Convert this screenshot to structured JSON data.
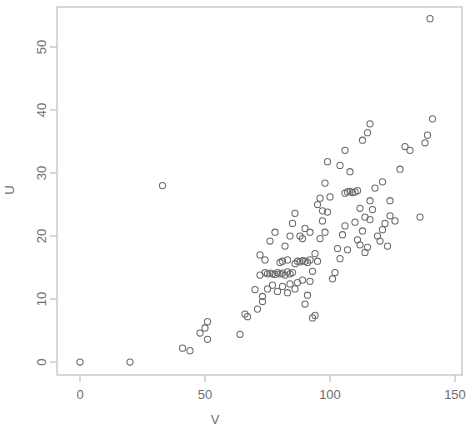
{
  "chart_data": {
    "type": "scatter",
    "title": "",
    "subtitle": "",
    "xlabel": "V",
    "ylabel": "U",
    "xlim": [
      -5,
      150
    ],
    "ylim": [
      -2,
      57
    ],
    "xticks": [
      0,
      50,
      100,
      150
    ],
    "yticks": [
      0,
      10,
      20,
      30,
      40,
      50
    ],
    "xtick_labels": [
      "0",
      "50",
      "100",
      "150"
    ],
    "ytick_labels": [
      "0",
      "10",
      "20",
      "30",
      "40",
      "50"
    ],
    "grid": false,
    "legend": null,
    "marker": "open-circle",
    "marker_color": "#6a6a6a",
    "marker_radius_px": 3.1,
    "annotations": [],
    "n_points": 120,
    "points": [
      [
        0,
        0
      ],
      [
        20,
        0
      ],
      [
        33,
        28
      ],
      [
        41,
        2.2
      ],
      [
        44,
        1.8
      ],
      [
        48,
        4.6
      ],
      [
        50,
        5.4
      ],
      [
        51,
        3.6
      ],
      [
        51,
        6.4
      ],
      [
        64,
        4.4
      ],
      [
        66,
        7.6
      ],
      [
        67,
        7.2
      ],
      [
        70,
        11.5
      ],
      [
        71,
        8.4
      ],
      [
        72,
        13.8
      ],
      [
        73,
        9.6
      ],
      [
        74,
        14.2
      ],
      [
        75,
        14.0
      ],
      [
        76,
        14.1
      ],
      [
        77,
        14.0
      ],
      [
        78,
        13.9
      ],
      [
        79,
        14.2
      ],
      [
        80,
        14.0
      ],
      [
        81,
        14.1
      ],
      [
        82,
        13.8
      ],
      [
        83,
        14.3
      ],
      [
        84,
        14.0
      ],
      [
        85,
        14.2
      ],
      [
        72,
        17.0
      ],
      [
        74,
        16.2
      ],
      [
        76,
        19.2
      ],
      [
        78,
        20.6
      ],
      [
        80,
        15.8
      ],
      [
        81,
        16.0
      ],
      [
        82,
        18.4
      ],
      [
        83,
        16.2
      ],
      [
        84,
        20.0
      ],
      [
        85,
        22.0
      ],
      [
        86,
        23.6
      ],
      [
        73,
        10.4
      ],
      [
        75,
        11.6
      ],
      [
        77,
        12.2
      ],
      [
        79,
        11.2
      ],
      [
        81,
        12.0
      ],
      [
        83,
        11.0
      ],
      [
        84,
        12.4
      ],
      [
        86,
        11.6
      ],
      [
        86,
        15.6
      ],
      [
        87,
        16.0
      ],
      [
        88,
        15.9
      ],
      [
        89,
        16.1
      ],
      [
        90,
        16.0
      ],
      [
        91,
        15.8
      ],
      [
        92,
        16.2
      ],
      [
        88,
        20.0
      ],
      [
        89,
        19.6
      ],
      [
        90,
        21.2
      ],
      [
        92,
        20.6
      ],
      [
        87,
        12.6
      ],
      [
        89,
        13.0
      ],
      [
        90,
        9.2
      ],
      [
        91,
        10.6
      ],
      [
        92,
        12.8
      ],
      [
        93,
        7.0
      ],
      [
        94,
        7.4
      ],
      [
        93,
        14.4
      ],
      [
        94,
        17.2
      ],
      [
        95,
        16.0
      ],
      [
        96,
        19.6
      ],
      [
        97,
        22.4
      ],
      [
        98,
        20.6
      ],
      [
        99,
        23.8
      ],
      [
        95,
        25.0
      ],
      [
        96,
        26.0
      ],
      [
        97,
        24.0
      ],
      [
        98,
        28.4
      ],
      [
        99,
        31.8
      ],
      [
        100,
        26.2
      ],
      [
        101,
        13.2
      ],
      [
        102,
        14.2
      ],
      [
        103,
        18.0
      ],
      [
        104,
        16.4
      ],
      [
        105,
        20.2
      ],
      [
        106,
        21.6
      ],
      [
        107,
        17.8
      ],
      [
        106,
        26.8
      ],
      [
        107,
        27.0
      ],
      [
        108,
        27.1
      ],
      [
        109,
        26.9
      ],
      [
        110,
        27.0
      ],
      [
        111,
        27.2
      ],
      [
        104,
        31.2
      ],
      [
        106,
        33.6
      ],
      [
        108,
        30.2
      ],
      [
        110,
        22.2
      ],
      [
        111,
        19.4
      ],
      [
        112,
        18.6
      ],
      [
        113,
        20.8
      ],
      [
        114,
        17.4
      ],
      [
        115,
        18.2
      ],
      [
        116,
        22.6
      ],
      [
        112,
        24.4
      ],
      [
        114,
        23.0
      ],
      [
        116,
        25.6
      ],
      [
        117,
        24.2
      ],
      [
        113,
        35.2
      ],
      [
        115,
        36.4
      ],
      [
        116,
        37.8
      ],
      [
        118,
        27.6
      ],
      [
        119,
        20.0
      ],
      [
        120,
        19.2
      ],
      [
        121,
        21.0
      ],
      [
        122,
        22.0
      ],
      [
        123,
        18.4
      ],
      [
        124,
        23.2
      ],
      [
        121,
        28.6
      ],
      [
        124,
        25.6
      ],
      [
        126,
        22.4
      ],
      [
        128,
        30.6
      ],
      [
        130,
        34.2
      ],
      [
        132,
        33.6
      ],
      [
        136,
        23.0
      ],
      [
        138,
        34.8
      ],
      [
        139,
        36.0
      ],
      [
        140,
        54.5
      ],
      [
        141,
        38.6
      ]
    ]
  },
  "axes": {
    "y_axis_label": "U",
    "x_axis_label": "V"
  }
}
